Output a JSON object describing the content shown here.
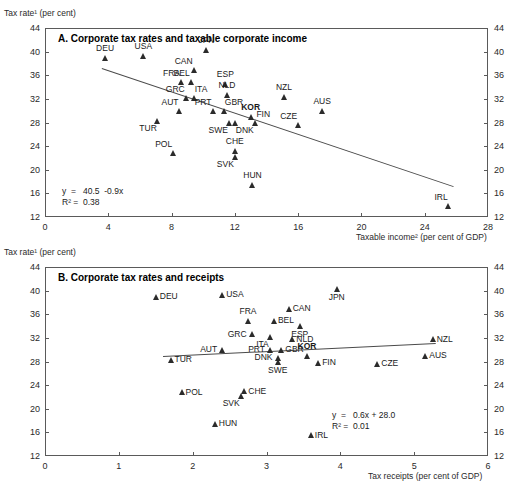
{
  "figure": {
    "panels": [
      {
        "id": "A",
        "title": "A. Corporate tax rates and taxable corporate income",
        "y_axis_label": "Tax rate¹ (per cent)",
        "x_axis_label": "Taxable income² (per cent of GDP)",
        "equation": "y  =   40.5  -0.9x",
        "r2": "R² =  0.38"
      },
      {
        "id": "B",
        "title": "B. Corporate tax rates and receipts",
        "y_axis_label": "Tax rate¹ (per cent)",
        "x_axis_label": "Tax receipts (per cent of GDP)",
        "equation": "y  =   0.6x + 28.0",
        "r2": "R² =  0.01"
      }
    ]
  },
  "chart_data": [
    {
      "type": "scatter",
      "panel": "A",
      "title": "A. Corporate tax rates and taxable corporate income",
      "xlabel": "Taxable income² (per cent of GDP)",
      "ylabel": "Tax rate¹ (per cent)",
      "xlim": [
        0,
        28
      ],
      "ylim": [
        12,
        44
      ],
      "xticks": [
        0,
        4,
        8,
        12,
        16,
        20,
        24,
        28
      ],
      "yticks": [
        12,
        16,
        20,
        24,
        28,
        32,
        36,
        40,
        44
      ],
      "grid": false,
      "legend": "none",
      "trendline": {
        "slope": -0.9,
        "intercept": 40.5,
        "r2": 0.38,
        "x_start": 3.6,
        "x_end": 25.8
      },
      "points": [
        {
          "label": "DEU",
          "x": 3.8,
          "y": 39.0,
          "label_pos": "above"
        },
        {
          "label": "USA",
          "x": 6.2,
          "y": 39.3,
          "label_pos": "above"
        },
        {
          "label": "JPN",
          "x": 10.2,
          "y": 40.2,
          "label_pos": "above"
        },
        {
          "label": "CAN",
          "x": 9.4,
          "y": 36.9,
          "label_pos": "above-left"
        },
        {
          "label": "BEL",
          "x": 9.2,
          "y": 34.8,
          "label_pos": "above-left"
        },
        {
          "label": "FRA",
          "x": 8.6,
          "y": 34.8,
          "label_pos": "above-left"
        },
        {
          "label": "ESP",
          "x": 11.4,
          "y": 34.6,
          "label_pos": "above"
        },
        {
          "label": "NLD",
          "x": 11.5,
          "y": 32.6,
          "label_pos": "above"
        },
        {
          "label": "GRC",
          "x": 8.9,
          "y": 32.2,
          "label_pos": "above-left"
        },
        {
          "label": "ITA",
          "x": 9.4,
          "y": 32.2,
          "label_pos": "above-right"
        },
        {
          "label": "AUT",
          "x": 8.5,
          "y": 30.0,
          "label_pos": "above-left"
        },
        {
          "label": "PRT",
          "x": 10.6,
          "y": 30.0,
          "label_pos": "above-left"
        },
        {
          "label": "GBR",
          "x": 11.3,
          "y": 30.0,
          "label_pos": "above-right"
        },
        {
          "label": "KOR",
          "x": 13.0,
          "y": 29.0,
          "label_pos": "above",
          "bold": true
        },
        {
          "label": "FIN",
          "x": 13.3,
          "y": 28.0,
          "label_pos": "above-right"
        },
        {
          "label": "SWE",
          "x": 11.6,
          "y": 28.0,
          "label_pos": "below-left"
        },
        {
          "label": "DNK",
          "x": 12.0,
          "y": 28.0,
          "label_pos": "below-right"
        },
        {
          "label": "TUR",
          "x": 7.1,
          "y": 28.3,
          "label_pos": "below-left"
        },
        {
          "label": "NZL",
          "x": 15.1,
          "y": 32.3,
          "label_pos": "above"
        },
        {
          "label": "AUS",
          "x": 17.5,
          "y": 30.0,
          "label_pos": "above"
        },
        {
          "label": "CZE",
          "x": 16.0,
          "y": 27.6,
          "label_pos": "above-left"
        },
        {
          "label": "POL",
          "x": 8.1,
          "y": 22.8,
          "label_pos": "above-left"
        },
        {
          "label": "CHE",
          "x": 12.0,
          "y": 23.2,
          "label_pos": "above"
        },
        {
          "label": "SVK",
          "x": 12.0,
          "y": 22.2,
          "label_pos": "below-left"
        },
        {
          "label": "HUN",
          "x": 13.1,
          "y": 17.5,
          "label_pos": "above"
        },
        {
          "label": "IRL",
          "x": 25.5,
          "y": 13.8,
          "label_pos": "above-left"
        }
      ]
    },
    {
      "type": "scatter",
      "panel": "B",
      "title": "B. Corporate tax rates and receipts",
      "xlabel": "Tax receipts (per cent of GDP)",
      "ylabel": "Tax rate¹ (per cent)",
      "xlim": [
        0,
        6
      ],
      "ylim": [
        12,
        44
      ],
      "xticks": [
        0,
        1,
        2,
        3,
        4,
        5,
        6
      ],
      "yticks": [
        12,
        16,
        20,
        24,
        28,
        32,
        36,
        40,
        44
      ],
      "grid": false,
      "legend": "none",
      "trendline": {
        "slope": 0.6,
        "intercept": 28.0,
        "r2": 0.01,
        "x_start": 1.6,
        "x_end": 5.3
      },
      "points": [
        {
          "label": "DEU",
          "x": 1.5,
          "y": 39.0,
          "label_pos": "right"
        },
        {
          "label": "USA",
          "x": 2.4,
          "y": 39.3,
          "label_pos": "right"
        },
        {
          "label": "JPN",
          "x": 3.95,
          "y": 40.2,
          "label_pos": "below"
        },
        {
          "label": "CAN",
          "x": 3.3,
          "y": 36.9,
          "label_pos": "right"
        },
        {
          "label": "FRA",
          "x": 2.75,
          "y": 34.9,
          "label_pos": "above"
        },
        {
          "label": "BEL",
          "x": 3.1,
          "y": 34.9,
          "label_pos": "right"
        },
        {
          "label": "ESP",
          "x": 3.45,
          "y": 34.0,
          "label_pos": "below"
        },
        {
          "label": "GRC",
          "x": 2.8,
          "y": 32.6,
          "label_pos": "left"
        },
        {
          "label": "ITA",
          "x": 3.05,
          "y": 32.2,
          "label_pos": "below-left"
        },
        {
          "label": "NLD",
          "x": 3.35,
          "y": 31.8,
          "label_pos": "right"
        },
        {
          "label": "NZL",
          "x": 5.25,
          "y": 31.8,
          "label_pos": "right"
        },
        {
          "label": "AUT",
          "x": 2.4,
          "y": 30.0,
          "label_pos": "left"
        },
        {
          "label": "PRT",
          "x": 3.05,
          "y": 30.0,
          "label_pos": "left"
        },
        {
          "label": "GBR",
          "x": 3.2,
          "y": 30.0,
          "label_pos": "right"
        },
        {
          "label": "AUS",
          "x": 5.15,
          "y": 29.0,
          "label_pos": "right"
        },
        {
          "label": "KOR",
          "x": 3.55,
          "y": 29.0,
          "label_pos": "above",
          "bold": true
        },
        {
          "label": "DNK",
          "x": 3.15,
          "y": 28.6,
          "label_pos": "left"
        },
        {
          "label": "TUR",
          "x": 1.7,
          "y": 28.3,
          "label_pos": "right"
        },
        {
          "label": "SWE",
          "x": 3.15,
          "y": 28.0,
          "label_pos": "below"
        },
        {
          "label": "FIN",
          "x": 3.7,
          "y": 27.8,
          "label_pos": "right"
        },
        {
          "label": "CZE",
          "x": 4.5,
          "y": 27.6,
          "label_pos": "right"
        },
        {
          "label": "CHE",
          "x": 2.7,
          "y": 23.0,
          "label_pos": "right"
        },
        {
          "label": "SVK",
          "x": 2.65,
          "y": 22.2,
          "label_pos": "below-left"
        },
        {
          "label": "POL",
          "x": 1.85,
          "y": 22.8,
          "label_pos": "right"
        },
        {
          "label": "HUN",
          "x": 2.3,
          "y": 17.5,
          "label_pos": "right"
        },
        {
          "label": "IRL",
          "x": 3.6,
          "y": 15.5,
          "label_pos": "right"
        }
      ]
    }
  ]
}
